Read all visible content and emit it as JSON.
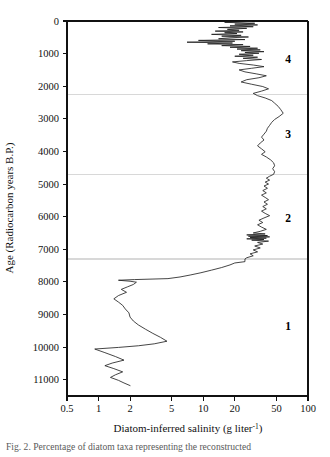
{
  "figure": {
    "name": "diatom-inferred-salinity-core-profile",
    "caption_line": "Fig. 2.   Percentage of diatom taxa representing the reconstructed"
  },
  "chart_data": {
    "type": "line",
    "title": "",
    "xlabel_main": "Diatom-inferred salinity (g liter",
    "xlabel_sup": "-1",
    "xlabel_close": ")",
    "xlabel": "Diatom-inferred salinity (g liter-1)",
    "ylabel": "Age (Radiocarbon years B.P.)",
    "xscale": "log",
    "xlim": [
      0.5,
      100
    ],
    "ylim": [
      0,
      11500
    ],
    "y_inverted": true,
    "grid": false,
    "legend": null,
    "xticks": [
      0.5,
      1,
      2,
      5,
      10,
      20,
      50,
      100
    ],
    "xtick_labels": [
      "0.5",
      "1",
      "2",
      "5",
      "10",
      "20",
      "50",
      "100"
    ],
    "yticks": [
      0,
      1000,
      2000,
      3000,
      4000,
      5000,
      6000,
      7000,
      8000,
      9000,
      10000,
      11000
    ],
    "ytick_labels": [
      "0",
      "1000",
      "2000",
      "3000",
      "4000",
      "5000",
      "6000",
      "7000",
      "8000",
      "9000",
      "10000",
      "11000"
    ],
    "zone_boundaries": [
      2250,
      4700,
      7300
    ],
    "zones": [
      {
        "label": "4",
        "age_top": 0,
        "age_bottom": 2250,
        "label_age": 1150
      },
      {
        "label": "3",
        "age_top": 2250,
        "age_bottom": 4700,
        "label_age": 3450
      },
      {
        "label": "2",
        "age_top": 4700,
        "age_bottom": 7300,
        "label_age": 6050
      },
      {
        "label": "1",
        "age_top": 7300,
        "age_bottom": 11400,
        "label_age": 9350
      }
    ],
    "series": [
      {
        "name": "Diatom-inferred salinity",
        "x_label": "salinity (g/L)",
        "y_label": "age (14C yr BP)",
        "points": [
          [
            29,
            10
          ],
          [
            16,
            40
          ],
          [
            31,
            70
          ],
          [
            20,
            95
          ],
          [
            33,
            120
          ],
          [
            18,
            150
          ],
          [
            30,
            175
          ],
          [
            14,
            200
          ],
          [
            26,
            225
          ],
          [
            17,
            255
          ],
          [
            22,
            285
          ],
          [
            13,
            310
          ],
          [
            24,
            335
          ],
          [
            16,
            360
          ],
          [
            21,
            385
          ],
          [
            12,
            410
          ],
          [
            23,
            440
          ],
          [
            15,
            465
          ],
          [
            27,
            490
          ],
          [
            18,
            515
          ],
          [
            14,
            545
          ],
          [
            25,
            570
          ],
          [
            9,
            595
          ],
          [
            20,
            620
          ],
          [
            7,
            650
          ],
          [
            19,
            675
          ],
          [
            11,
            700
          ],
          [
            24,
            725
          ],
          [
            15,
            755
          ],
          [
            28,
            780
          ],
          [
            18,
            805
          ],
          [
            33,
            835
          ],
          [
            21,
            860
          ],
          [
            35,
            885
          ],
          [
            23,
            910
          ],
          [
            38,
            940
          ],
          [
            25,
            965
          ],
          [
            34,
            990
          ],
          [
            22,
            1020
          ],
          [
            30,
            1050
          ],
          [
            20,
            1080
          ],
          [
            33,
            1110
          ],
          [
            24,
            1145
          ],
          [
            36,
            1180
          ],
          [
            26,
            1215
          ],
          [
            19,
            1255
          ],
          [
            22,
            1300
          ],
          [
            30,
            1350
          ],
          [
            38,
            1400
          ],
          [
            29,
            1450
          ],
          [
            22,
            1500
          ],
          [
            25,
            1560
          ],
          [
            32,
            1620
          ],
          [
            40,
            1680
          ],
          [
            34,
            1740
          ],
          [
            26,
            1800
          ],
          [
            23,
            1870
          ],
          [
            29,
            1940
          ],
          [
            37,
            2010
          ],
          [
            42,
            2080
          ],
          [
            36,
            2150
          ],
          [
            30,
            2220
          ],
          [
            33,
            2290
          ],
          [
            39,
            2360
          ],
          [
            45,
            2440
          ],
          [
            48,
            2520
          ],
          [
            52,
            2620
          ],
          [
            55,
            2720
          ],
          [
            58,
            2830
          ],
          [
            53,
            2930
          ],
          [
            48,
            3020
          ],
          [
            45,
            3110
          ],
          [
            43,
            3200
          ],
          [
            41,
            3290
          ],
          [
            40,
            3380
          ],
          [
            38,
            3470
          ],
          [
            36,
            3560
          ],
          [
            38,
            3650
          ],
          [
            35,
            3740
          ],
          [
            33,
            3830
          ],
          [
            36,
            3920
          ],
          [
            39,
            4010
          ],
          [
            36,
            4090
          ],
          [
            40,
            4170
          ],
          [
            44,
            4260
          ],
          [
            47,
            4350
          ],
          [
            48,
            4440
          ],
          [
            46,
            4530
          ],
          [
            48,
            4620
          ],
          [
            47,
            4700
          ],
          [
            43,
            4760
          ],
          [
            40,
            4820
          ],
          [
            43,
            4880
          ],
          [
            39,
            4940
          ],
          [
            42,
            5000
          ],
          [
            38,
            5060
          ],
          [
            41,
            5130
          ],
          [
            37,
            5200
          ],
          [
            40,
            5270
          ],
          [
            36,
            5340
          ],
          [
            39,
            5410
          ],
          [
            42,
            5480
          ],
          [
            38,
            5550
          ],
          [
            41,
            5620
          ],
          [
            37,
            5690
          ],
          [
            40,
            5760
          ],
          [
            36,
            5830
          ],
          [
            39,
            5900
          ],
          [
            43,
            5970
          ],
          [
            38,
            6040
          ],
          [
            34,
            6110
          ],
          [
            37,
            6180
          ],
          [
            33,
            6250
          ],
          [
            36,
            6320
          ],
          [
            40,
            6390
          ],
          [
            35,
            6450
          ],
          [
            30,
            6500
          ],
          [
            39,
            6530
          ],
          [
            26,
            6560
          ],
          [
            41,
            6580
          ],
          [
            27,
            6600
          ],
          [
            43,
            6620
          ],
          [
            28,
            6640
          ],
          [
            40,
            6660
          ],
          [
            26,
            6680
          ],
          [
            38,
            6700
          ],
          [
            29,
            6720
          ],
          [
            42,
            6750
          ],
          [
            33,
            6790
          ],
          [
            37,
            6840
          ],
          [
            31,
            6900
          ],
          [
            35,
            6960
          ],
          [
            30,
            7020
          ],
          [
            33,
            7080
          ],
          [
            28,
            7140
          ],
          [
            30,
            7200
          ],
          [
            26,
            7260
          ],
          [
            25,
            7300
          ],
          [
            25,
            7380
          ],
          [
            20,
            7420
          ],
          [
            18,
            7480
          ],
          [
            15,
            7560
          ],
          [
            12,
            7640
          ],
          [
            9.5,
            7720
          ],
          [
            7.5,
            7790
          ],
          [
            6.0,
            7850
          ],
          [
            4.6,
            7900
          ],
          [
            2.2,
            7930
          ],
          [
            1.55,
            7950
          ],
          [
            2.0,
            7980
          ],
          [
            2.3,
            8010
          ],
          [
            2.15,
            8080
          ],
          [
            1.9,
            8150
          ],
          [
            1.65,
            8230
          ],
          [
            1.85,
            8320
          ],
          [
            1.55,
            8420
          ],
          [
            1.4,
            8520
          ],
          [
            1.55,
            8620
          ],
          [
            1.7,
            8720
          ],
          [
            1.8,
            8830
          ],
          [
            1.95,
            8950
          ],
          [
            2.0,
            9080
          ],
          [
            2.15,
            9200
          ],
          [
            2.4,
            9320
          ],
          [
            2.8,
            9450
          ],
          [
            3.3,
            9580
          ],
          [
            3.9,
            9700
          ],
          [
            4.5,
            9820
          ],
          [
            3.4,
            9900
          ],
          [
            2.4,
            9960
          ],
          [
            1.55,
            10010
          ],
          [
            0.92,
            10060
          ],
          [
            1.15,
            10170
          ],
          [
            1.45,
            10290
          ],
          [
            1.75,
            10400
          ],
          [
            1.35,
            10490
          ],
          [
            1.15,
            10570
          ],
          [
            1.4,
            10660
          ],
          [
            1.7,
            10760
          ],
          [
            1.45,
            10850
          ],
          [
            1.3,
            10930
          ],
          [
            1.55,
            11020
          ],
          [
            1.75,
            11100
          ],
          [
            2.0,
            11180
          ]
        ]
      }
    ]
  }
}
